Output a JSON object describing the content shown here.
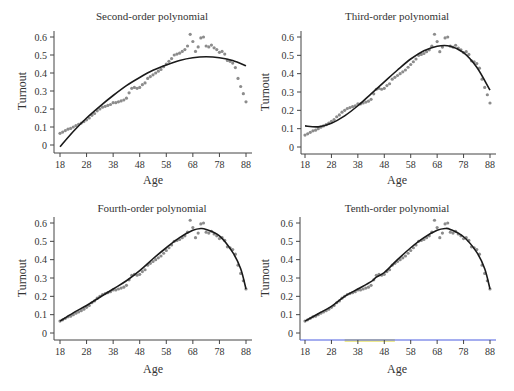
{
  "chart_data": [
    {
      "type": "scatter",
      "title": "Second-order polynomial",
      "xlabel": "Age",
      "ylabel": "Turnout",
      "xticks": [
        18,
        28,
        38,
        48,
        58,
        68,
        78,
        88
      ],
      "yticks": [
        0,
        0.1,
        0.2,
        0.3,
        0.4,
        0.5,
        0.6
      ],
      "xlim": [
        18,
        88
      ],
      "ylim": [
        0,
        0.6
      ],
      "grid": false,
      "series": [
        {
          "name": "Observed turnout",
          "kind": "points"
        },
        {
          "name": "Second-order polynomial fit",
          "kind": "line",
          "x": [
            18,
            23,
            28,
            33,
            38,
            43,
            48,
            53,
            58,
            63,
            68,
            73,
            78,
            83,
            88
          ],
          "y": [
            -0.01,
            0.075,
            0.15,
            0.215,
            0.275,
            0.33,
            0.375,
            0.415,
            0.445,
            0.47,
            0.485,
            0.49,
            0.485,
            0.47,
            0.44
          ]
        }
      ]
    },
    {
      "type": "scatter",
      "title": "Third-order polynomial",
      "xlabel": "Age",
      "ylabel": "Turnout",
      "xticks": [
        18,
        28,
        38,
        48,
        58,
        68,
        78,
        88
      ],
      "yticks": [
        0,
        0.1,
        0.2,
        0.3,
        0.4,
        0.5,
        0.6
      ],
      "xlim": [
        18,
        88
      ],
      "ylim": [
        0,
        0.6
      ],
      "grid": false,
      "series": [
        {
          "name": "Observed turnout",
          "kind": "points"
        },
        {
          "name": "Third-order polynomial fit",
          "kind": "line",
          "x": [
            18,
            23,
            28,
            33,
            38,
            43,
            48,
            53,
            58,
            63,
            68,
            73,
            78,
            83,
            88
          ],
          "y": [
            0.115,
            0.11,
            0.13,
            0.17,
            0.225,
            0.29,
            0.355,
            0.42,
            0.48,
            0.525,
            0.55,
            0.55,
            0.515,
            0.435,
            0.31
          ]
        }
      ]
    },
    {
      "type": "scatter",
      "title": "Fourth-order polynomial",
      "xlabel": "Age",
      "ylabel": "Turnout",
      "xticks": [
        18,
        28,
        38,
        48,
        58,
        68,
        78,
        88
      ],
      "yticks": [
        0,
        0.1,
        0.2,
        0.3,
        0.4,
        0.5,
        0.6
      ],
      "xlim": [
        18,
        88
      ],
      "ylim": [
        0,
        0.6
      ],
      "grid": false,
      "series": [
        {
          "name": "Observed turnout",
          "kind": "points"
        },
        {
          "name": "Fourth-order polynomial fit",
          "kind": "line",
          "x": [
            18,
            23,
            28,
            33,
            38,
            43,
            48,
            53,
            58,
            63,
            68,
            71,
            73,
            78,
            83,
            86,
            88
          ],
          "y": [
            0.065,
            0.11,
            0.15,
            0.195,
            0.24,
            0.285,
            0.34,
            0.405,
            0.465,
            0.52,
            0.56,
            0.57,
            0.565,
            0.53,
            0.44,
            0.35,
            0.24
          ]
        }
      ]
    },
    {
      "type": "scatter",
      "title": "Tenth-order polynomial",
      "xlabel": "Age",
      "ylabel": "Turnout",
      "xticks": [
        18,
        28,
        38,
        48,
        58,
        68,
        78,
        88
      ],
      "yticks": [
        0,
        0.1,
        0.2,
        0.3,
        0.4,
        0.5,
        0.6
      ],
      "xlim": [
        18,
        88
      ],
      "ylim": [
        0,
        0.6
      ],
      "grid": false,
      "series": [
        {
          "name": "Observed turnout",
          "kind": "points"
        },
        {
          "name": "Tenth-order polynomial fit",
          "kind": "line",
          "x": [
            18,
            23,
            28,
            33,
            38,
            43,
            45,
            48,
            53,
            58,
            63,
            68,
            71,
            73,
            78,
            83,
            86,
            88
          ],
          "y": [
            0.065,
            0.105,
            0.145,
            0.2,
            0.24,
            0.28,
            0.305,
            0.33,
            0.4,
            0.465,
            0.52,
            0.56,
            0.57,
            0.565,
            0.525,
            0.44,
            0.35,
            0.24
          ]
        }
      ]
    }
  ],
  "observed": {
    "ages": [
      18,
      19,
      20,
      21,
      22,
      23,
      24,
      25,
      26,
      27,
      28,
      29,
      30,
      31,
      32,
      33,
      34,
      35,
      36,
      37,
      38,
      39,
      40,
      41,
      42,
      43,
      44,
      45,
      46,
      47,
      48,
      49,
      50,
      51,
      52,
      53,
      54,
      55,
      56,
      57,
      58,
      59,
      60,
      61,
      62,
      63,
      64,
      65,
      66,
      67,
      68,
      69,
      70,
      71,
      72,
      73,
      74,
      75,
      76,
      77,
      78,
      79,
      80,
      81,
      82,
      83,
      84,
      85,
      86,
      87,
      88
    ],
    "turnout": [
      0.065,
      0.072,
      0.08,
      0.088,
      0.092,
      0.1,
      0.108,
      0.115,
      0.122,
      0.13,
      0.14,
      0.15,
      0.165,
      0.175,
      0.19,
      0.2,
      0.21,
      0.215,
      0.22,
      0.225,
      0.235,
      0.235,
      0.24,
      0.245,
      0.25,
      0.26,
      0.29,
      0.315,
      0.32,
      0.315,
      0.32,
      0.335,
      0.345,
      0.37,
      0.38,
      0.39,
      0.4,
      0.41,
      0.42,
      0.435,
      0.45,
      0.465,
      0.48,
      0.5,
      0.505,
      0.51,
      0.52,
      0.53,
      0.55,
      0.615,
      0.575,
      0.52,
      0.545,
      0.595,
      0.6,
      0.55,
      0.545,
      0.555,
      0.54,
      0.53,
      0.515,
      0.52,
      0.505,
      0.47,
      0.465,
      0.455,
      0.43,
      0.37,
      0.325,
      0.285,
      0.24
    ]
  },
  "panels": [
    {
      "title": "Second-order polynomial",
      "xlabel": "Age",
      "ylabel": "Turnout"
    },
    {
      "title": "Third-order polynomial",
      "xlabel": "Age",
      "ylabel": "Turnout"
    },
    {
      "title": "Fourth-order polynomial",
      "xlabel": "Age",
      "ylabel": "Turnout"
    },
    {
      "title": "Tenth-order polynomial",
      "xlabel": "Age",
      "ylabel": "Turnout"
    }
  ],
  "colors": {
    "points": "#8c8c8c",
    "fit_line": "#1a1a1a",
    "axis": "#444444",
    "text": "#333333",
    "panel4_axis_line": "#4a5de0",
    "panel4_highlight": "#e6e060"
  }
}
